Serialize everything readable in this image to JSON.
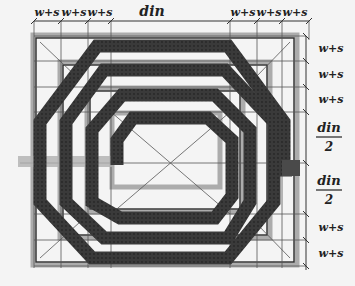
{
  "diagram": {
    "top_labels": {
      "left_spacings": [
        "w+s",
        "w+s",
        "w+s"
      ],
      "center": "din",
      "right_spacings": [
        "w+s",
        "w+s",
        "w+s"
      ]
    },
    "right_labels": {
      "upper_spacings": [
        "w+s",
        "w+s",
        "w+s"
      ],
      "half_din_upper": {
        "numerator": "din",
        "denominator": "2"
      },
      "half_din_lower": {
        "numerator": "din",
        "denominator": "2"
      },
      "lower_spacings": [
        "w+s",
        "w+s"
      ]
    },
    "colors": {
      "background": "#f4f4f4",
      "trace": "#3a3a3a",
      "square_outline": "#9a9a9a",
      "grid_line": "#555555",
      "label": "#222222"
    },
    "turns": 4
  }
}
